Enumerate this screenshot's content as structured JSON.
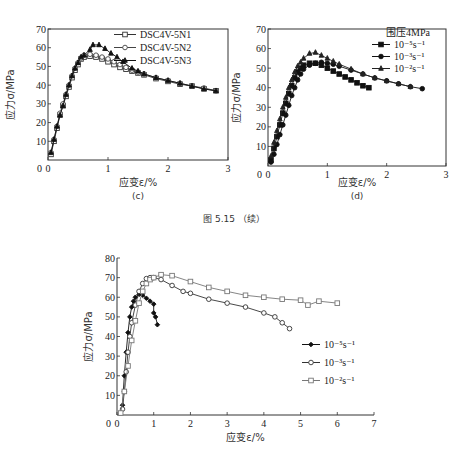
{
  "figure_caption": "图 5.15 （续）",
  "chart_data": [
    {
      "id": "c",
      "type": "line",
      "panel_label": "(c)",
      "title": "",
      "xlabel": "应变ε/%",
      "ylabel": "应力σ/MPa",
      "xlim": [
        0,
        3
      ],
      "ylim": [
        0,
        70
      ],
      "xticks": [
        "0",
        "1",
        "2",
        "3"
      ],
      "yticks": [
        "10",
        "20",
        "30",
        "40",
        "50",
        "60",
        "70"
      ],
      "grid": false,
      "legend_position": "upper right",
      "series": [
        {
          "name": "DSC4V-5N1",
          "marker": "square-open",
          "x": [
            0.05,
            0.1,
            0.15,
            0.2,
            0.25,
            0.3,
            0.35,
            0.4,
            0.45,
            0.5,
            0.55,
            0.6,
            0.7,
            0.8,
            0.9,
            1.0,
            1.1,
            1.2,
            1.3,
            1.4,
            1.5,
            1.6,
            1.8,
            2.0,
            2.2,
            2.4,
            2.6,
            2.8
          ],
          "y": [
            3,
            10,
            17,
            24,
            29,
            34,
            39,
            44,
            48,
            51,
            54,
            55,
            55.5,
            55,
            54,
            52.5,
            51,
            49.5,
            48.5,
            47.5,
            46.5,
            45.5,
            43.5,
            42,
            40.5,
            39.5,
            38,
            37
          ]
        },
        {
          "name": "DSC4V-5N2",
          "marker": "circle-open",
          "x": [
            0.05,
            0.1,
            0.15,
            0.2,
            0.25,
            0.3,
            0.35,
            0.4,
            0.45,
            0.5,
            0.55,
            0.6,
            0.7,
            0.8,
            0.9,
            1.0,
            1.1,
            1.2,
            1.3,
            1.4,
            1.5,
            1.6,
            1.8,
            2.0,
            2.2,
            2.4,
            2.6,
            2.8
          ],
          "y": [
            4,
            11,
            18,
            25,
            30,
            35,
            40,
            45,
            49,
            52,
            54.5,
            56,
            56.5,
            56,
            55,
            54,
            52.5,
            51,
            49.5,
            48,
            47,
            46,
            44,
            42.5,
            41,
            39.5,
            38.5,
            37
          ]
        },
        {
          "name": "DSC4V-5N3",
          "marker": "triangle-filled",
          "x": [
            0.05,
            0.1,
            0.15,
            0.2,
            0.25,
            0.3,
            0.35,
            0.4,
            0.45,
            0.5,
            0.55,
            0.6,
            0.7,
            0.75,
            0.85,
            0.95,
            1.05,
            1.15,
            1.25,
            1.4,
            1.5,
            1.6,
            1.8,
            2.0,
            2.2,
            2.4,
            2.6,
            2.8
          ],
          "y": [
            4,
            11,
            18,
            24,
            29,
            35,
            40,
            45,
            49,
            52,
            55,
            56,
            59,
            61.5,
            61.5,
            59.5,
            57,
            55,
            52.5,
            49,
            47.5,
            46,
            44,
            42.5,
            41,
            39.5,
            38,
            37
          ]
        }
      ]
    },
    {
      "id": "d",
      "type": "line",
      "panel_label": "(d)",
      "title": "",
      "xlabel": "应变ε/%",
      "ylabel": "应力σ/MPa",
      "xlim": [
        0,
        3
      ],
      "ylim": [
        0,
        70
      ],
      "xticks": [
        "0",
        "1",
        "2",
        "3"
      ],
      "yticks": [
        "10",
        "20",
        "30",
        "40",
        "50",
        "60",
        "70"
      ],
      "grid": false,
      "legend_title": "围压4MPa",
      "legend_position": "upper right",
      "series": [
        {
          "name": "10⁻⁵s⁻¹",
          "marker": "square-filled",
          "x": [
            0.05,
            0.1,
            0.15,
            0.2,
            0.25,
            0.3,
            0.35,
            0.4,
            0.45,
            0.5,
            0.55,
            0.6,
            0.7,
            0.8,
            0.9,
            1.0,
            1.1,
            1.2,
            1.3,
            1.4,
            1.5,
            1.6,
            1.7
          ],
          "y": [
            3,
            9,
            15,
            21,
            27,
            32,
            37,
            41,
            45,
            48,
            50,
            51.5,
            52.5,
            52.5,
            51.5,
            50,
            48.5,
            47,
            45.5,
            44,
            42.5,
            41,
            40
          ]
        },
        {
          "name": "10⁻³s⁻¹",
          "marker": "circle-filled",
          "x": [
            0.05,
            0.1,
            0.15,
            0.2,
            0.25,
            0.3,
            0.35,
            0.4,
            0.45,
            0.5,
            0.55,
            0.6,
            0.7,
            0.8,
            0.9,
            1.0,
            1.1,
            1.2,
            1.4,
            1.6,
            1.8,
            2.0,
            2.2,
            2.4,
            2.6
          ],
          "y": [
            2,
            6,
            11,
            16,
            21,
            26,
            31,
            36,
            40,
            44,
            47,
            49.5,
            51.5,
            52.5,
            53,
            52.5,
            52,
            51,
            49,
            47,
            45,
            43.5,
            42,
            40.5,
            39.5
          ]
        },
        {
          "name": "10⁻²s⁻¹",
          "marker": "triangle-filled",
          "x": [
            0.05,
            0.1,
            0.15,
            0.2,
            0.25,
            0.3,
            0.35,
            0.4,
            0.45,
            0.5,
            0.55,
            0.6,
            0.7,
            0.8,
            0.9,
            1.0,
            1.1,
            1.2,
            1.4,
            1.6,
            1.8,
            2.0,
            2.2,
            2.4
          ],
          "y": [
            5,
            12,
            18,
            24,
            30,
            35,
            40,
            44,
            48,
            51,
            53,
            55,
            57.5,
            58,
            56.5,
            55,
            53.5,
            52,
            49.5,
            47,
            45,
            43.5,
            42,
            40.5
          ]
        }
      ]
    },
    {
      "id": "e",
      "type": "line",
      "panel_label": "",
      "title": "",
      "xlabel": "应变ε/%",
      "ylabel": "应力σ/MPa",
      "xlim": [
        0,
        7
      ],
      "ylim": [
        0,
        80
      ],
      "xticks": [
        "0",
        "1",
        "2",
        "3",
        "4",
        "5",
        "6",
        "7"
      ],
      "yticks": [
        "10",
        "20",
        "30",
        "40",
        "50",
        "60",
        "70",
        "80"
      ],
      "grid": false,
      "legend_position": "center right",
      "series": [
        {
          "name": "10⁻⁵s⁻¹",
          "marker": "diamond-filled",
          "x": [
            0.15,
            0.2,
            0.25,
            0.3,
            0.35,
            0.4,
            0.45,
            0.5,
            0.6,
            0.7,
            0.8,
            0.9,
            1.0,
            1.0,
            1.05,
            1.1
          ],
          "y": [
            5,
            20,
            32,
            42,
            50,
            55,
            58,
            60,
            61.5,
            61,
            59.5,
            58,
            56.5,
            52,
            50,
            46
          ]
        },
        {
          "name": "10⁻³s⁻¹",
          "marker": "circle-open",
          "x": [
            0.15,
            0.2,
            0.25,
            0.3,
            0.35,
            0.4,
            0.5,
            0.6,
            0.7,
            0.8,
            0.9,
            1.0,
            1.2,
            1.5,
            1.8,
            2.0,
            2.5,
            3.0,
            3.5,
            4.0,
            4.3,
            4.5,
            4.7
          ],
          "y": [
            3,
            12,
            22,
            32,
            40,
            47,
            56,
            63,
            67,
            69.5,
            70,
            70,
            69,
            66,
            63,
            62,
            59,
            57,
            55,
            52,
            50,
            47,
            44
          ]
        },
        {
          "name": "10⁻²s⁻¹",
          "marker": "square-open",
          "x": [
            0.1,
            0.2,
            0.3,
            0.4,
            0.5,
            0.6,
            0.7,
            0.8,
            0.9,
            1.0,
            1.2,
            1.5,
            2.0,
            2.5,
            3.0,
            3.5,
            4.0,
            4.5,
            5.0,
            5.2,
            5.5,
            6.0
          ],
          "y": [
            1,
            12,
            25,
            38,
            48,
            57,
            63,
            67,
            69,
            70,
            71.5,
            71,
            68,
            65,
            63,
            61,
            60,
            59,
            58.5,
            56,
            58,
            57
          ]
        }
      ]
    }
  ]
}
